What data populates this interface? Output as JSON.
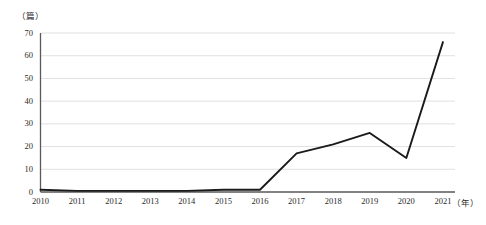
{
  "chart_data": {
    "type": "line",
    "title": "",
    "xlabel": "（年）",
    "ylabel": "（篇）",
    "categories": [
      "2010",
      "2011",
      "2012",
      "2013",
      "2014",
      "2015",
      "2016",
      "2017",
      "2018",
      "2019",
      "2020",
      "2021"
    ],
    "series": [
      {
        "name": "篇数",
        "values": [
          1,
          0.5,
          0.5,
          0.5,
          0.5,
          1,
          1,
          17,
          21,
          26,
          15,
          66
        ]
      }
    ],
    "ylim": [
      0,
      70
    ],
    "yticks": [
      0,
      10,
      20,
      30,
      40,
      50,
      60,
      70
    ],
    "ytick_labels": [
      "0",
      "10",
      "20",
      "30",
      "40",
      "50",
      "60",
      "70"
    ],
    "grid": true,
    "grid_axis": "y",
    "legend": "none",
    "line_color": "#1a1a1a",
    "grid_color": "#d8d8d8",
    "axis_color": "#595959",
    "markers": false
  }
}
